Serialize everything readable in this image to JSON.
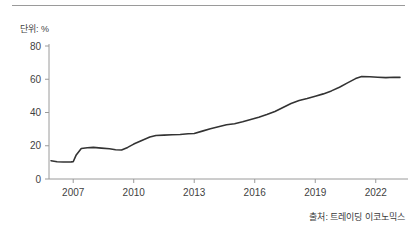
{
  "unit_label": "단위: %",
  "source_note": "출처: 트레이딩 이코노믹스",
  "colors": {
    "line": "#333333",
    "axis": "#9a9a9a",
    "text": "#3f3f3f",
    "rule": "#9a9a9a",
    "background": "#ffffff"
  },
  "chart_data": {
    "type": "line",
    "title": "",
    "subtitle": "",
    "xlabel": "",
    "ylabel": "단위: %",
    "unit": "%",
    "grid": false,
    "legend": "none",
    "xlim": [
      2005.8,
      2023.4
    ],
    "ylim": [
      0,
      80
    ],
    "ytick_labels": [
      "0",
      "20",
      "40",
      "60",
      "80"
    ],
    "yticks": [
      0,
      20,
      40,
      60,
      80
    ],
    "xtick_labels": [
      "2007",
      "2010",
      "2013",
      "2016",
      "2019",
      "2022"
    ],
    "xticks": [
      2007,
      2010,
      2013,
      2016,
      2019,
      2022
    ],
    "series": [
      {
        "name": "value",
        "x": [
          2005.9,
          2006.2,
          2006.5,
          2006.75,
          2006.9,
          2007.0,
          2007.15,
          2007.4,
          2007.7,
          2008.0,
          2008.4,
          2008.8,
          2009.1,
          2009.4,
          2009.7,
          2010.0,
          2010.4,
          2010.8,
          2011.1,
          2011.5,
          2011.9,
          2012.3,
          2012.7,
          2013.0,
          2013.4,
          2013.8,
          2014.2,
          2014.6,
          2015.0,
          2015.4,
          2015.8,
          2016.2,
          2016.6,
          2017.0,
          2017.4,
          2017.8,
          2018.2,
          2018.6,
          2019.0,
          2019.4,
          2019.8,
          2020.2,
          2020.6,
          2021.0,
          2021.3,
          2021.7,
          2022.1,
          2022.5,
          2022.9,
          2023.2
        ],
        "y": [
          11.0,
          10.4,
          10.2,
          10.2,
          10.3,
          10.4,
          14.5,
          18.3,
          18.8,
          19.0,
          18.6,
          18.2,
          17.6,
          17.4,
          19.0,
          21.0,
          23.2,
          25.2,
          26.2,
          26.4,
          26.6,
          26.8,
          27.2,
          27.4,
          28.8,
          30.2,
          31.4,
          32.6,
          33.2,
          34.4,
          35.8,
          37.2,
          38.8,
          40.6,
          43.0,
          45.4,
          47.2,
          48.4,
          49.8,
          51.2,
          53.0,
          55.2,
          57.8,
          60.4,
          61.6,
          61.5,
          61.2,
          61.0,
          61.2,
          61.1
        ]
      }
    ]
  }
}
